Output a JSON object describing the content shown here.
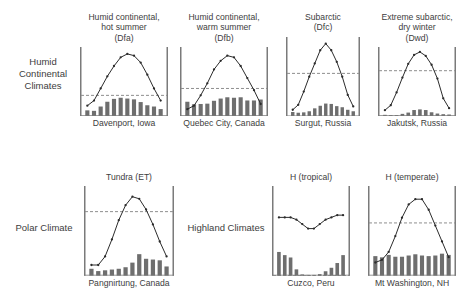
{
  "figure": {
    "groups": [
      {
        "id": "humid",
        "label": "Humid\nContinental\nClimates"
      },
      {
        "id": "polar",
        "label": "Polar Climate"
      },
      {
        "id": "highland",
        "label": "Highland Climates"
      }
    ]
  },
  "style": {
    "bar_color": "#6e6e6e",
    "line_color": "#2b2b2b",
    "axis_color": "#7a7a7a",
    "dashed_color": "#8e8e8e",
    "text_color": "#3d3d3d"
  },
  "chart_data": [
    {
      "id": "davenport",
      "type": "line",
      "title": "Humid continental,\nhot summer\n(Dfa)",
      "subtitle": "(Dfa)",
      "caption": "Davenport, Iowa",
      "xlabel": "",
      "ylabel": "",
      "grid": false,
      "legend": "none",
      "reference_line": 0,
      "categories": [
        "J",
        "F",
        "M",
        "A",
        "M",
        "J",
        "J",
        "A",
        "S",
        "O",
        "N",
        "D"
      ],
      "series": [
        {
          "name": "Temperature (°C)",
          "type": "line",
          "values": [
            -6,
            -3,
            4,
            11,
            17,
            22,
            24,
            23,
            19,
            12,
            4,
            -3
          ]
        },
        {
          "name": "Precipitation (mm)",
          "type": "bar",
          "values": [
            36,
            33,
            60,
            90,
            108,
            115,
            110,
            105,
            88,
            68,
            60,
            44
          ]
        }
      ],
      "temp_ylim": [
        -12,
        28
      ],
      "precip_ylim": [
        0,
        130
      ]
    },
    {
      "id": "quebec",
      "type": "line",
      "title": "Humid continental,\nwarm summer\n(Dfb)",
      "subtitle": "(Dfb)",
      "caption": "Quebec City, Canada",
      "xlabel": "",
      "ylabel": "",
      "grid": false,
      "legend": "none",
      "reference_line": 0,
      "categories": [
        "J",
        "F",
        "M",
        "A",
        "M",
        "J",
        "J",
        "A",
        "S",
        "O",
        "N",
        "D"
      ],
      "series": [
        {
          "name": "Temperature (°C)",
          "type": "line",
          "values": [
            -12,
            -10,
            -4,
            3,
            11,
            16,
            19,
            18,
            13,
            6,
            -1,
            -9
          ]
        },
        {
          "name": "Precipitation (mm)",
          "type": "bar",
          "values": [
            90,
            74,
            76,
            78,
            96,
            110,
            118,
            115,
            118,
            98,
            98,
            104
          ]
        }
      ],
      "temp_ylim": [
        -16,
        24
      ],
      "precip_ylim": [
        0,
        130
      ]
    },
    {
      "id": "surgut",
      "type": "line",
      "title": "Subarctic\n(Dfc)",
      "subtitle": "(Dfc)",
      "caption": "Surgut, Russia",
      "xlabel": "",
      "ylabel": "",
      "grid": false,
      "legend": "none",
      "reference_line": 0,
      "categories": [
        "J",
        "F",
        "M",
        "A",
        "M",
        "J",
        "J",
        "A",
        "S",
        "O",
        "N",
        "D"
      ],
      "series": [
        {
          "name": "Temperature (°C)",
          "type": "line",
          "values": [
            -22,
            -19,
            -11,
            -2,
            6,
            14,
            18,
            14,
            7,
            -2,
            -13,
            -20
          ]
        },
        {
          "name": "Precipitation (mm)",
          "type": "bar",
          "values": [
            24,
            20,
            22,
            28,
            44,
            58,
            70,
            68,
            56,
            50,
            36,
            28
          ]
        }
      ],
      "temp_ylim": [
        -26,
        22
      ],
      "precip_ylim": [
        0,
        130
      ]
    },
    {
      "id": "jakutsk",
      "type": "line",
      "title": "Extreme subarctic,\ndry winter\n(Dwd)",
      "subtitle": "(Dwd)",
      "caption": "Jakutsk, Russia",
      "xlabel": "",
      "ylabel": "",
      "grid": false,
      "legend": "none",
      "reference_line": 0,
      "categories": [
        "J",
        "F",
        "M",
        "A",
        "M",
        "J",
        "J",
        "A",
        "S",
        "O",
        "N",
        "D"
      ],
      "series": [
        {
          "name": "Temperature (°C)",
          "type": "line",
          "values": [
            -40,
            -35,
            -22,
            -7,
            7,
            16,
            19,
            15,
            6,
            -8,
            -28,
            -38
          ]
        },
        {
          "name": "Precipitation (mm)",
          "type": "bar",
          "values": [
            8,
            6,
            6,
            14,
            22,
            38,
            42,
            38,
            24,
            16,
            12,
            10
          ]
        }
      ],
      "temp_ylim": [
        -46,
        24
      ],
      "precip_ylim": [
        0,
        130
      ]
    },
    {
      "id": "pangnirtung",
      "type": "line",
      "title": "Tundra (ET)",
      "subtitle": "",
      "caption": "Pangnirtung, Canada",
      "xlabel": "",
      "ylabel": "",
      "grid": false,
      "legend": "none",
      "reference_line": 0,
      "categories": [
        "J",
        "F",
        "M",
        "A",
        "M",
        "J",
        "J",
        "A",
        "S",
        "O",
        "N",
        "D"
      ],
      "series": [
        {
          "name": "Temperature (°C)",
          "type": "line",
          "values": [
            -25,
            -25,
            -21,
            -13,
            -4,
            3,
            7,
            6,
            1,
            -6,
            -14,
            -21
          ]
        },
        {
          "name": "Precipitation (mm)",
          "type": "bar",
          "values": [
            18,
            12,
            14,
            16,
            18,
            22,
            34,
            56,
            44,
            42,
            40,
            24
          ]
        }
      ],
      "temp_ylim": [
        -30,
        12
      ],
      "precip_ylim": [
        0,
        70
      ]
    },
    {
      "id": "cuzco",
      "type": "line",
      "title": "H (tropical)",
      "subtitle": "",
      "caption": "Cuzco, Peru",
      "xlabel": "",
      "ylabel": "",
      "grid": false,
      "legend": "none",
      "reference_line": 0,
      "categories": [
        "J",
        "F",
        "M",
        "A",
        "M",
        "J",
        "J",
        "A",
        "S",
        "O",
        "N",
        "D"
      ],
      "series": [
        {
          "name": "Temperature (°C)",
          "type": "line",
          "values": [
            13,
            13,
            13,
            12.5,
            11.5,
            10.5,
            10.5,
            11.5,
            12.5,
            13,
            13.5,
            13.5
          ]
        },
        {
          "name": "Precipitation (mm)",
          "type": "bar",
          "values": [
            150,
            130,
            115,
            40,
            8,
            4,
            5,
            10,
            28,
            50,
            80,
            130
          ]
        }
      ],
      "temp_ylim": [
        0,
        20
      ],
      "precip_ylim": [
        0,
        170
      ]
    },
    {
      "id": "mt-washington",
      "type": "line",
      "title": "H (temperate)",
      "subtitle": "",
      "caption": "Mt Washington, NH",
      "xlabel": "",
      "ylabel": "",
      "grid": false,
      "legend": "none",
      "reference_line": 0,
      "categories": [
        "J",
        "F",
        "M",
        "A",
        "M",
        "J",
        "J",
        "A",
        "S",
        "O",
        "N",
        "D"
      ],
      "series": [
        {
          "name": "Temperature (°C)",
          "type": "line",
          "values": [
            -15,
            -14,
            -11,
            -5,
            2,
            7,
            9,
            9,
            5,
            -1,
            -7,
            -13
          ]
        },
        {
          "name": "Precipitation (mm)",
          "type": "bar",
          "values": [
            160,
            150,
            170,
            155,
            155,
            165,
            175,
            165,
            160,
            165,
            180,
            170
          ]
        }
      ],
      "temp_ylim": [
        -20,
        14
      ],
      "precip_ylim": [
        0,
        220
      ]
    }
  ],
  "panels": [
    {
      "id": "davenport",
      "x": 80,
      "y": 12,
      "w": 88,
      "h": 118
    },
    {
      "id": "quebec",
      "x": 180,
      "y": 12,
      "w": 88,
      "h": 118
    },
    {
      "id": "surgut",
      "x": 286,
      "y": 12,
      "w": 74,
      "h": 118
    },
    {
      "id": "jakutsk",
      "x": 378,
      "y": 12,
      "w": 78,
      "h": 118
    },
    {
      "id": "pangnirtung",
      "x": 84,
      "y": 172,
      "w": 90,
      "h": 118
    },
    {
      "id": "cuzco",
      "x": 272,
      "y": 172,
      "w": 78,
      "h": 118
    },
    {
      "id": "mt-washington",
      "x": 368,
      "y": 172,
      "w": 88,
      "h": 118
    }
  ]
}
